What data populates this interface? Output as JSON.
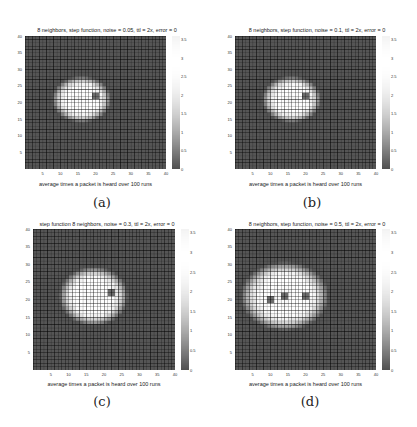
{
  "figure": {
    "panels": [
      {
        "id": "a",
        "label": "(a)",
        "title": "8 neighbors, step function, noise = 0.05, ttl = 2x, error = 0",
        "xlabel": "average times a packet is heard over 100 runs",
        "xticks": [
          "5",
          "10",
          "15",
          "20",
          "25",
          "30",
          "35",
          "40"
        ],
        "yticks": [
          "5",
          "10",
          "15",
          "20",
          "25",
          "30",
          "35",
          "40"
        ],
        "colorbar_ticks": [
          "3.5",
          "3",
          "2.5",
          "2",
          "1.5",
          "1",
          "0.5",
          "0"
        ]
      },
      {
        "id": "b",
        "label": "(b)",
        "title": "8 neighbors, step function, noise = 0.1, ttl = 2x, error = 0",
        "xlabel": "average times a packet is heard over 100 runs",
        "xticks": [
          "5",
          "10",
          "15",
          "20",
          "25",
          "30",
          "35",
          "40"
        ],
        "yticks": [
          "5",
          "10",
          "15",
          "20",
          "25",
          "30",
          "35",
          "40"
        ],
        "colorbar_ticks": [
          "3.5",
          "3",
          "2.5",
          "2",
          "1.5",
          "1",
          "0.5",
          "0"
        ]
      },
      {
        "id": "c",
        "label": "(c)",
        "title": "step function 8 neighbors, noise = 0.3, ttl = 2x, error = 0",
        "xlabel": "average times a packet is heard over 100 runs",
        "xticks": [
          "5",
          "10",
          "15",
          "20",
          "25",
          "30",
          "35",
          "40"
        ],
        "yticks": [
          "5",
          "10",
          "15",
          "20",
          "25",
          "30",
          "35",
          "40"
        ],
        "colorbar_ticks": [
          "3.5",
          "3",
          "2.5",
          "2",
          "1.5",
          "1",
          "0.5",
          "0"
        ]
      },
      {
        "id": "d",
        "label": "(d)",
        "title": "8 neighbors, step function, noise = 0.5, ttl = 2x, error = 0",
        "xlabel": "average times a packet is heard over 100 runs",
        "xticks": [
          "5",
          "10",
          "15",
          "20",
          "25",
          "30",
          "35",
          "40"
        ],
        "yticks": [
          "5",
          "10",
          "15",
          "20",
          "25",
          "30",
          "35",
          "40"
        ],
        "colorbar_ticks": [
          "3.5",
          "3",
          "2.5",
          "2",
          "1.5",
          "1",
          "0.5",
          "0"
        ]
      }
    ]
  },
  "chart_data": [
    {
      "type": "heatmap",
      "title": "8 neighbors, step function, noise = 0.05, ttl = 2x, error = 0",
      "xlabel": "average times a packet is heard over 100 runs",
      "ylabel": "",
      "grid_size": [
        40,
        40
      ],
      "xlim": [
        0,
        40
      ],
      "ylim": [
        0,
        40
      ],
      "colorbar_range": [
        0,
        3.5
      ],
      "blob": {
        "center_x": 16,
        "center_y": 21,
        "radius_x": 6,
        "radius_y": 5,
        "peak_value": 3.0
      },
      "dark_spot": {
        "x": 20,
        "y": 22
      },
      "background_value": 0
    },
    {
      "type": "heatmap",
      "title": "8 neighbors, step function, noise = 0.1, ttl = 2x, error = 0",
      "xlabel": "average times a packet is heard over 100 runs",
      "ylabel": "",
      "grid_size": [
        40,
        40
      ],
      "xlim": [
        0,
        40
      ],
      "ylim": [
        0,
        40
      ],
      "colorbar_range": [
        0,
        3.5
      ],
      "blob": {
        "center_x": 16,
        "center_y": 21,
        "radius_x": 6,
        "radius_y": 5,
        "peak_value": 3.0
      },
      "dark_spot": {
        "x": 20,
        "y": 22
      },
      "background_value": 0
    },
    {
      "type": "heatmap",
      "title": "step function 8 neighbors, noise = 0.3, ttl = 2x, error = 0",
      "xlabel": "average times a packet is heard over 100 runs",
      "ylabel": "",
      "grid_size": [
        40,
        40
      ],
      "xlim": [
        0,
        40
      ],
      "ylim": [
        0,
        40
      ],
      "colorbar_range": [
        0,
        3.5
      ],
      "blob": {
        "center_x": 17,
        "center_y": 21,
        "radius_x": 7,
        "radius_y": 6,
        "peak_value": 3.0
      },
      "dark_spot": {
        "x": 22,
        "y": 22
      },
      "background_value": 0
    },
    {
      "type": "heatmap",
      "title": "8 neighbors, step function, noise = 0.5, ttl = 2x, error = 0",
      "xlabel": "average times a packet is heard over 100 runs",
      "ylabel": "",
      "grid_size": [
        40,
        40
      ],
      "xlim": [
        0,
        40
      ],
      "ylim": [
        0,
        40
      ],
      "colorbar_range": [
        0,
        3.5
      ],
      "blob": {
        "center_x": 14,
        "center_y": 21,
        "radius_x": 9,
        "radius_y": 7,
        "peak_value": 3.0
      },
      "dark_spots": [
        {
          "x": 10,
          "y": 20
        },
        {
          "x": 14,
          "y": 21
        },
        {
          "x": 20,
          "y": 21
        }
      ],
      "background_value": 0
    }
  ]
}
